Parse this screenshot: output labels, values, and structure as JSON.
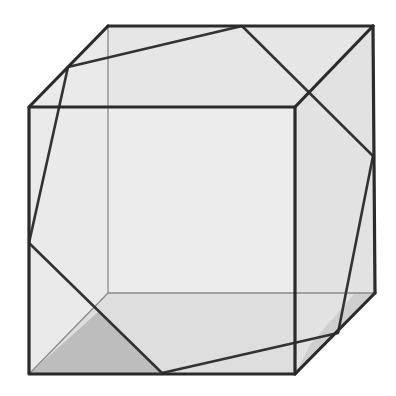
{
  "figure": {
    "colors": {
      "background": "#ffffff",
      "face_light": "#ececec",
      "face_top": "#e3e3e3",
      "face_bottom": "#dcdcdc",
      "face_right": "#e0e0e0",
      "shade_dark": "#bdbdbd",
      "edge": "#2b2b2b",
      "hidden_edge": "#8a8a8a"
    },
    "cube": {
      "front_top_left": [
        29,
        107
      ],
      "front_top_right": [
        295,
        107
      ],
      "front_bottom_right": [
        295,
        374
      ],
      "front_bottom_left": [
        29,
        374
      ],
      "back_top_left": [
        108,
        26
      ],
      "back_top_right": [
        373,
        26
      ],
      "back_bottom_right": [
        375,
        293
      ],
      "back_bottom_left": [
        108,
        293
      ]
    },
    "hexagon": [
      [
        242,
        26
      ],
      [
        68,
        67
      ],
      [
        29,
        243
      ],
      [
        162,
        373
      ],
      [
        338,
        333
      ],
      [
        373,
        156
      ]
    ]
  }
}
